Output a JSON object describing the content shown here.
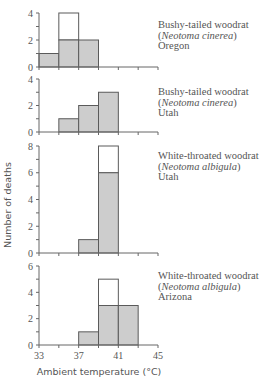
{
  "chart_data": {
    "type": "bar",
    "subtype": "stacked-histogram",
    "xlabel": "Ambient temperature (°C)",
    "ylabel": "Number of deaths",
    "x_ticks": [
      33,
      35,
      37,
      39,
      41,
      43,
      45
    ],
    "x_tick_labels": [
      "33",
      "37",
      "41",
      "45"
    ],
    "bin_width": 2,
    "xlim": [
      33,
      45
    ],
    "series_legend": {
      "shaded": "deaths (shaded portion)",
      "open": "additional deaths (open portion)"
    },
    "panels": [
      {
        "title": "Bushy-tailed woodrat",
        "species": "Neotoma cinerea",
        "location": "Oregon",
        "ylim": [
          0,
          4
        ],
        "y_ticks": [
          0,
          2,
          4
        ],
        "bins": [
          {
            "x0": 33,
            "x1": 35,
            "shaded": 1,
            "total": 1
          },
          {
            "x0": 35,
            "x1": 37,
            "shaded": 2,
            "total": 4
          },
          {
            "x0": 37,
            "x1": 39,
            "shaded": 2,
            "total": 2
          }
        ]
      },
      {
        "title": "Bushy-tailed woodrat",
        "species": "Neotoma cinerea",
        "location": "Utah",
        "ylim": [
          0,
          4
        ],
        "y_ticks": [
          0,
          2,
          4
        ],
        "bins": [
          {
            "x0": 35,
            "x1": 37,
            "shaded": 1,
            "total": 1
          },
          {
            "x0": 37,
            "x1": 39,
            "shaded": 2,
            "total": 2
          },
          {
            "x0": 39,
            "x1": 41,
            "shaded": 3,
            "total": 3
          }
        ]
      },
      {
        "title": "White-throated woodrat",
        "species": "Neotoma albigula",
        "location": "Utah",
        "ylim": [
          0,
          8
        ],
        "y_ticks": [
          0,
          2,
          4,
          6,
          8
        ],
        "bins": [
          {
            "x0": 37,
            "x1": 39,
            "shaded": 1,
            "total": 1
          },
          {
            "x0": 39,
            "x1": 41,
            "shaded": 6,
            "total": 8
          }
        ]
      },
      {
        "title": "White-throated woodrat",
        "species": "Neotoma albigula",
        "location": "Arizona",
        "ylim": [
          0,
          6
        ],
        "y_ticks": [
          0,
          2,
          4,
          6
        ],
        "bins": [
          {
            "x0": 37,
            "x1": 39,
            "shaded": 1,
            "total": 1
          },
          {
            "x0": 39,
            "x1": 41,
            "shaded": 3,
            "total": 5
          },
          {
            "x0": 41,
            "x1": 43,
            "shaded": 3,
            "total": 3
          }
        ]
      }
    ]
  },
  "colors": {
    "shaded_fill": "#cdcdcd",
    "outline": "#5a5a5a",
    "axis": "#666666",
    "text": "#555555"
  },
  "legend": [
    {
      "common": "Bushy-tailed woodrat",
      "open_paren": "(",
      "sci": "Neotoma cinerea",
      "close_paren": ")",
      "location": "Oregon"
    },
    {
      "common": "Bushy-tailed woodrat",
      "open_paren": "(",
      "sci": "Neotoma cinerea",
      "close_paren": ")",
      "location": "Utah"
    },
    {
      "common": "White-throated woodrat",
      "open_paren": "(",
      "sci": "Neotoma albigula",
      "close_paren": ")",
      "location": "Utah"
    },
    {
      "common": "White-throated woodrat",
      "open_paren": "(",
      "sci": "Neotoma albigula",
      "close_paren": ")",
      "location": "Arizona"
    }
  ]
}
